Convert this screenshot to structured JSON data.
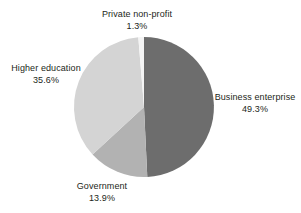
{
  "chart_data": {
    "type": "pie",
    "title": "",
    "subtitle": "",
    "xlabel": "",
    "ylabel": "",
    "legend_position": "none",
    "grid": false,
    "labels_show_percent": true,
    "categories": [
      "Business enterprise",
      "Government",
      "Higher education",
      "Private non-profit"
    ],
    "values": [
      49.3,
      13.9,
      35.6,
      1.3
    ],
    "unit": "%",
    "start_angle_deg": 0,
    "direction": "clockwise",
    "slices": [
      {
        "name": "Business enterprise",
        "value": 49.3,
        "value_label": "49.3%",
        "color": "#6d6d6d",
        "start_deg": 0,
        "end_deg": 177.48
      },
      {
        "name": "Government",
        "value": 13.9,
        "value_label": "13.9%",
        "color": "#b2b2b2",
        "start_deg": 177.48,
        "end_deg": 227.52
      },
      {
        "name": "Higher education",
        "value": 35.6,
        "value_label": "35.6%",
        "color": "#d4d4d4",
        "start_deg": 227.52,
        "end_deg": 355.32
      },
      {
        "name": "Private non-profit",
        "value": 1.3,
        "value_label": "1.3%",
        "color": "#f4f4f4",
        "start_deg": 355.32,
        "end_deg": 360
      }
    ]
  },
  "labels": {
    "private": {
      "name": "Private non-profit",
      "value": "1.3%"
    },
    "higher": {
      "name": "Higher education",
      "value": "35.6%"
    },
    "business": {
      "name": "Business enterprise",
      "value": "49.3%"
    },
    "government": {
      "name": "Government",
      "value": "13.9%"
    }
  },
  "colors": {
    "business": "#6d6d6d",
    "government": "#b2b2b2",
    "higher": "#d4d4d4",
    "private": "#f4f4f4",
    "text": "#231f20",
    "background": "#ffffff"
  }
}
